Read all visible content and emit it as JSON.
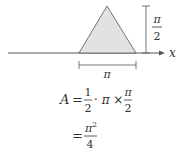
{
  "diagram": {
    "axis_label": "x",
    "height_label_num": "π",
    "height_label_den": "2",
    "base_label": "π",
    "colors": {
      "fill": "#e2e2e2",
      "stroke": "#555555",
      "text": "#333333"
    }
  },
  "formula": {
    "line1": {
      "lhs": "A",
      "eq": "=",
      "frac1_num": "1",
      "frac1_den": "2",
      "mid": "· π ×",
      "frac2_num": "π",
      "frac2_den": "2"
    },
    "line2": {
      "eq": "=",
      "num": "π",
      "num_sup": "2",
      "den": "4"
    }
  }
}
